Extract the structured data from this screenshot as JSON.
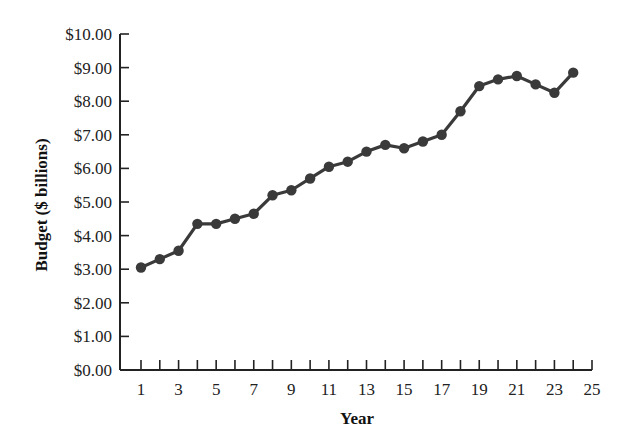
{
  "chart_data": {
    "type": "line",
    "title": "",
    "xlabel": "Year",
    "ylabel": "Budget ($ billions)",
    "x": [
      1,
      2,
      3,
      4,
      5,
      6,
      7,
      8,
      9,
      10,
      11,
      12,
      13,
      14,
      15,
      16,
      17,
      18,
      19,
      20,
      21,
      22,
      23,
      24
    ],
    "series": [
      {
        "name": "Budget",
        "values": [
          3.05,
          3.3,
          3.55,
          4.35,
          4.35,
          4.5,
          4.65,
          5.2,
          5.35,
          5.7,
          6.05,
          6.2,
          6.5,
          6.7,
          6.6,
          6.8,
          7.0,
          7.7,
          8.45,
          8.65,
          8.75,
          8.5,
          8.25,
          8.85
        ]
      }
    ],
    "xlim": [
      0,
      25
    ],
    "ylim": [
      0,
      10
    ],
    "x_ticks": [
      1,
      2,
      3,
      4,
      5,
      6,
      7,
      8,
      9,
      10,
      11,
      12,
      13,
      14,
      15,
      16,
      17,
      18,
      19,
      20,
      21,
      22,
      23,
      24,
      25
    ],
    "x_tick_labels": [
      "1",
      "3",
      "5",
      "7",
      "9",
      "11",
      "13",
      "15",
      "17",
      "19",
      "21",
      "23",
      "25"
    ],
    "x_tick_label_values": [
      1,
      3,
      5,
      7,
      9,
      11,
      13,
      15,
      17,
      19,
      21,
      23,
      25
    ],
    "y_ticks": [
      0,
      1,
      2,
      3,
      4,
      5,
      6,
      7,
      8,
      9,
      10
    ],
    "y_tick_labels": [
      "$0.00",
      "$1.00",
      "$2.00",
      "$3.00",
      "$4.00",
      "$5.00",
      "$6.00",
      "$7.00",
      "$8.00",
      "$9.00",
      "$10.00"
    ],
    "grid": false,
    "legend": "none",
    "marker": "circle",
    "line_color": "#3a3a3a",
    "marker_color": "#3a3a3a"
  }
}
